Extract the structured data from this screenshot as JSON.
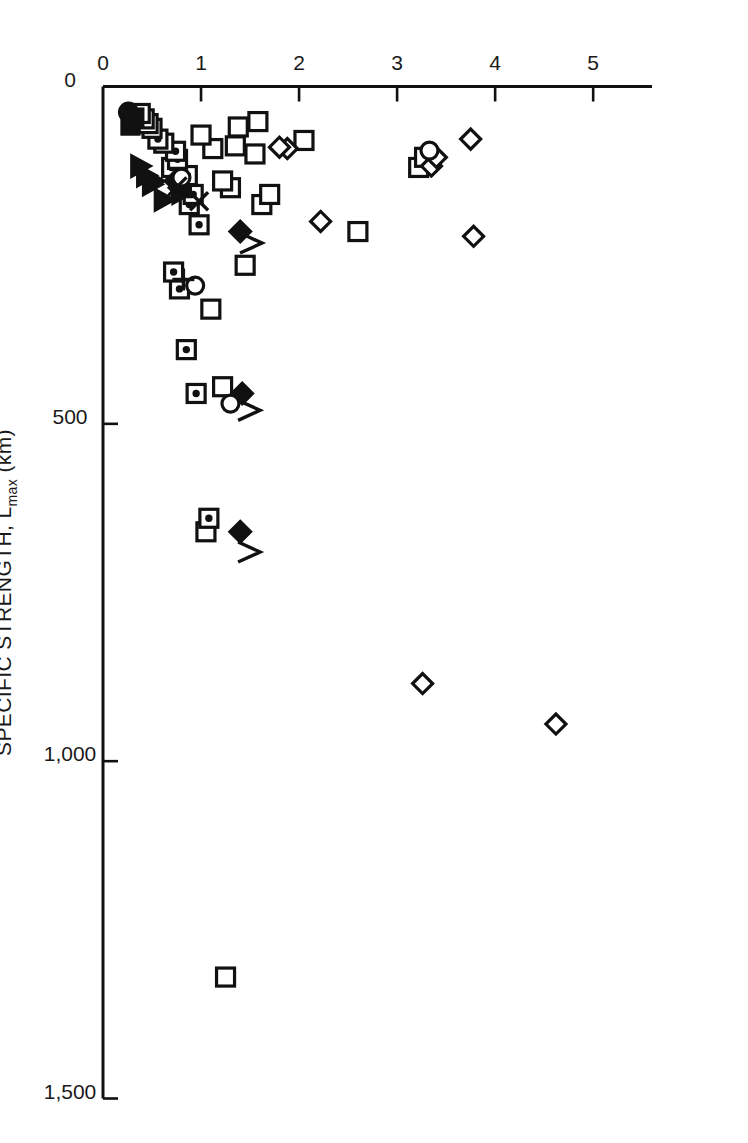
{
  "figure": {
    "background": "#ffffff",
    "ink": "#111111",
    "rotation_deg": 90,
    "note": "Scatter chart printed sideways (rotated 90 degrees) on the page."
  },
  "chart_data": {
    "type": "scatter",
    "title": "",
    "xlabel": "SPECIFIC STRENGTH, L",
    "xlabel_sub": "max",
    "xlabel_units": " (km)",
    "xlabel_full": "SPECIFIC STRENGTH, Lmax (km)",
    "ylabel": "SPECIFIC MODULUS ( × 10",
    "ylabel_sup1": "8",
    "ylabel_mid": "m",
    "ylabel_sup2": "2",
    "ylabel_mid2": "s",
    "ylabel_sup3": "-2",
    "ylabel_close": ")",
    "ylabel_full": "SPECIFIC MODULUS ( × 10⁸m²s⁻²)",
    "xlim": [
      0,
      1500
    ],
    "ylim": [
      0,
      5.6
    ],
    "xticks": [
      0,
      500,
      1000,
      1500
    ],
    "xticklabels": [
      "0",
      "500",
      "1,000",
      "1,500"
    ],
    "yticks": [
      0,
      1,
      2,
      3,
      4,
      5
    ],
    "yticklabels": [
      "0",
      "1",
      "2",
      "3",
      "4",
      "5"
    ],
    "grid": false,
    "legend": "none",
    "marker_kinds": [
      "open-square",
      "dotted-square",
      "open-diamond",
      "filled-diamond",
      "open-circle",
      "filled-circle",
      "filled-square",
      "filled-triangle",
      "open-triangle",
      "x-marker",
      "plus-marker"
    ],
    "series": [
      {
        "name": "open-square",
        "marker": "open-square",
        "points": [
          [
            1320,
            1.25
          ],
          [
            660,
            1.05
          ],
          [
            445,
            1.22
          ],
          [
            330,
            1.1
          ],
          [
            265,
            1.45
          ],
          [
            215,
            2.6
          ],
          [
            175,
            1.62
          ],
          [
            160,
            1.7
          ],
          [
            150,
            1.3
          ],
          [
            140,
            1.22
          ],
          [
            120,
            3.22
          ],
          [
            105,
            3.28
          ],
          [
            100,
            1.55
          ],
          [
            92,
            1.12
          ],
          [
            88,
            1.35
          ],
          [
            80,
            2.05
          ],
          [
            72,
            1.0
          ],
          [
            60,
            1.38
          ],
          [
            52,
            1.58
          ]
        ]
      },
      {
        "name": "dotted-square",
        "marker": "dotted-square",
        "points": [
          [
            640,
            1.08
          ],
          [
            455,
            0.95
          ],
          [
            390,
            0.85
          ],
          [
            300,
            0.78
          ],
          [
            275,
            0.72
          ],
          [
            205,
            0.98
          ],
          [
            175,
            0.88
          ],
          [
            160,
            0.92
          ],
          [
            150,
            0.8
          ],
          [
            132,
            0.86
          ],
          [
            120,
            0.7
          ],
          [
            108,
            0.76
          ],
          [
            96,
            0.74
          ],
          [
            84,
            0.62
          ],
          [
            78,
            0.56
          ],
          [
            62,
            0.5
          ],
          [
            55,
            0.46
          ],
          [
            48,
            0.42
          ],
          [
            40,
            0.38
          ]
        ]
      },
      {
        "name": "open-diamond",
        "marker": "open-diamond",
        "points": [
          [
            945,
            4.62
          ],
          [
            885,
            3.26
          ],
          [
            222,
            3.78
          ],
          [
            200,
            2.22
          ],
          [
            118,
            3.35
          ],
          [
            105,
            3.4
          ],
          [
            92,
            1.88
          ],
          [
            90,
            1.8
          ],
          [
            78,
            3.75
          ]
        ]
      },
      {
        "name": "filled-diamond",
        "marker": "filled-diamond",
        "points": [
          [
            660,
            1.4
          ],
          [
            455,
            1.42
          ],
          [
            215,
            1.4
          ],
          [
            150,
            0.78
          ],
          [
            140,
            0.74
          ]
        ]
      },
      {
        "name": "open-circle",
        "marker": "open-circle",
        "points": [
          [
            470,
            1.3
          ],
          [
            295,
            0.94
          ],
          [
            135,
            0.8
          ],
          [
            95,
            3.33
          ]
        ]
      },
      {
        "name": "filled-circle",
        "marker": "filled-circle",
        "points": [
          [
            38,
            0.26
          ]
        ]
      },
      {
        "name": "filled-square",
        "marker": "filled-square",
        "points": [
          [
            58,
            0.28
          ],
          [
            46,
            0.32
          ]
        ]
      },
      {
        "name": "filled-triangle",
        "marker": "filled-triangle",
        "points": [
          [
            168,
            0.62
          ],
          [
            158,
            0.8
          ],
          [
            145,
            0.5
          ],
          [
            140,
            0.52
          ],
          [
            132,
            0.44
          ],
          [
            118,
            0.38
          ]
        ]
      },
      {
        "name": "open-triangle",
        "marker": "open-triangle",
        "points": [
          [
            690,
            1.48
          ],
          [
            480,
            1.48
          ],
          [
            232,
            1.5
          ]
        ]
      },
      {
        "name": "x-marker",
        "marker": "x-marker",
        "points": [
          [
            170,
            0.98
          ],
          [
            148,
            0.76
          ]
        ]
      },
      {
        "name": "plus-marker",
        "marker": "plus-marker",
        "points": [
          [
            286,
            0.82
          ]
        ]
      }
    ]
  }
}
